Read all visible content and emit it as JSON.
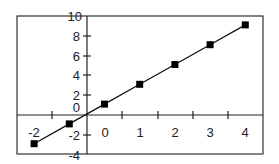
{
  "chart_data": {
    "type": "line",
    "title": "",
    "xlabel": "",
    "ylabel": "",
    "x": [
      -2,
      -1,
      0,
      1,
      2,
      3,
      4
    ],
    "series": [
      {
        "name": "y",
        "values": [
          -3,
          -1,
          1,
          3,
          5,
          7,
          9
        ],
        "marker": "square",
        "color": "#000000"
      }
    ],
    "x_tick_labels": [
      "-2",
      "0",
      "1",
      "2",
      "3",
      "4"
    ],
    "y_tick_labels": [
      "10",
      "8",
      "6",
      "4",
      "2",
      "0",
      "-2",
      "-4"
    ],
    "xlim": [
      -2.5,
      4.5
    ],
    "ylim": [
      -4,
      10
    ],
    "grid": false,
    "legend": "none"
  },
  "labels": {
    "y": [
      "10",
      "8",
      "6",
      "4",
      "2",
      "0",
      "-2",
      "-4"
    ],
    "x": [
      "-2",
      "0",
      "1",
      "2",
      "3",
      "4"
    ]
  }
}
